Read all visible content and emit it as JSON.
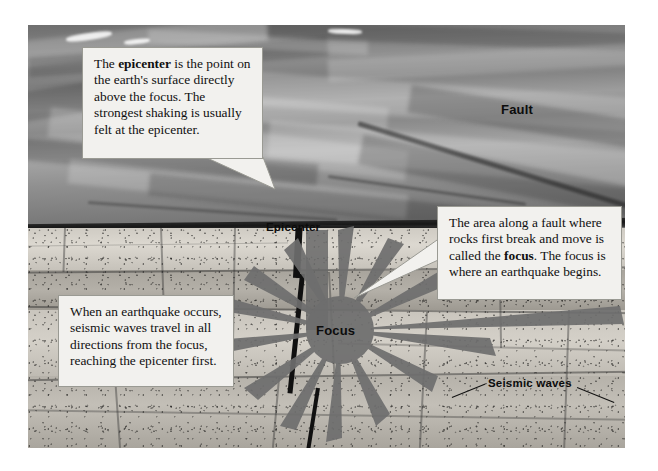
{
  "figure": {
    "kind": "earthquake-cross-section-diagram",
    "palette": {
      "callout_fill": "#f2f1ee",
      "callout_border": "#9a9a93",
      "label_text": "#0c0c0c",
      "starburst": "#6e6e6e",
      "crust_dark": "#171717"
    }
  },
  "labels": {
    "fault": "Fault",
    "epicenter": "Epicenter",
    "focus": "Focus",
    "seismic_waves": "Seismic waves"
  },
  "callouts": {
    "epicenter": {
      "lead": "The ",
      "term": "epicenter",
      "rest": " is the point on the earth's surface directly above the focus. The strongest shaking is usually felt at the epicenter."
    },
    "focus": {
      "lead": "The area along a fault where rocks first break and move is called the ",
      "term": "focus",
      "rest": ". The focus is where an earthquake begins."
    },
    "waves": {
      "text": "When an earthquake occurs, seismic waves travel in all directions from the focus, reaching the epicenter first."
    }
  }
}
